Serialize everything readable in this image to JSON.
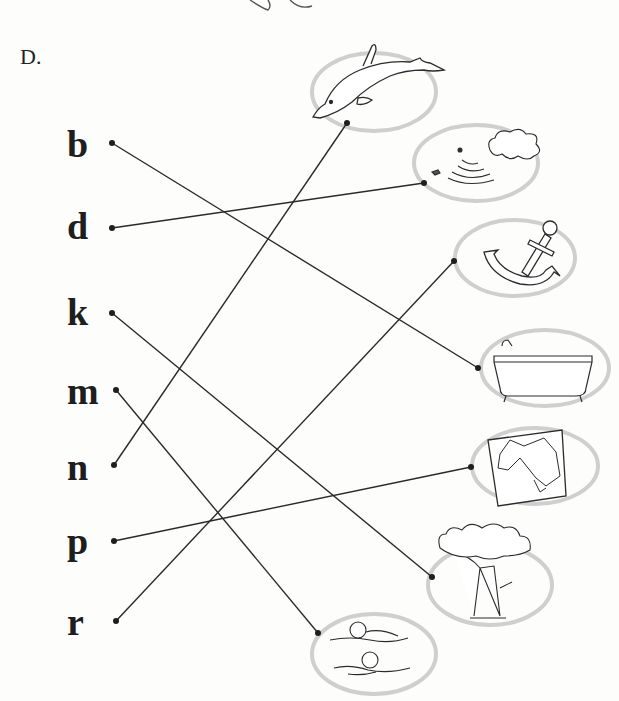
{
  "section": {
    "label": "D."
  },
  "letters": [
    {
      "id": "b",
      "text": "b",
      "top": 125,
      "dot": [
        112,
        143
      ]
    },
    {
      "id": "d",
      "text": "d",
      "top": 207,
      "dot": [
        112,
        228
      ]
    },
    {
      "id": "k",
      "text": "k",
      "top": 293,
      "dot": [
        112,
        313
      ]
    },
    {
      "id": "m",
      "text": "m",
      "top": 372,
      "dot": [
        116,
        390
      ]
    },
    {
      "id": "n",
      "text": "n",
      "top": 448,
      "dot": [
        114,
        465
      ]
    },
    {
      "id": "p",
      "text": "p",
      "top": 522,
      "dot": [
        114,
        541
      ]
    },
    {
      "id": "r",
      "text": "r",
      "top": 603,
      "dot": [
        116,
        621
      ]
    }
  ],
  "pictures": [
    {
      "id": "dolphin",
      "label": "dolphin",
      "dot": [
        347,
        123
      ]
    },
    {
      "id": "splash",
      "label": "splash",
      "dot": [
        424,
        183
      ]
    },
    {
      "id": "anchor",
      "label": "anchor",
      "dot": [
        454,
        261
      ]
    },
    {
      "id": "bathtub",
      "label": "bathtub",
      "dot": [
        478,
        368
      ]
    },
    {
      "id": "map",
      "label": "map",
      "dot": [
        471,
        467
      ]
    },
    {
      "id": "tree",
      "label": "tree",
      "dot": [
        432,
        577
      ]
    },
    {
      "id": "swimmers",
      "label": "swimmers",
      "dot": [
        318,
        633
      ]
    }
  ],
  "matches": [
    {
      "letter": "b",
      "picture": "bathtub"
    },
    {
      "letter": "d",
      "picture": "splash"
    },
    {
      "letter": "k",
      "picture": "tree"
    },
    {
      "letter": "m",
      "picture": "swimmers"
    },
    {
      "letter": "n",
      "picture": "dolphin"
    },
    {
      "letter": "p",
      "picture": "map"
    },
    {
      "letter": "r",
      "picture": "anchor"
    }
  ],
  "colors": {
    "line": "#2a2a2a",
    "ellipse": "#cfcfcf",
    "ink": "#2b2b2b"
  }
}
